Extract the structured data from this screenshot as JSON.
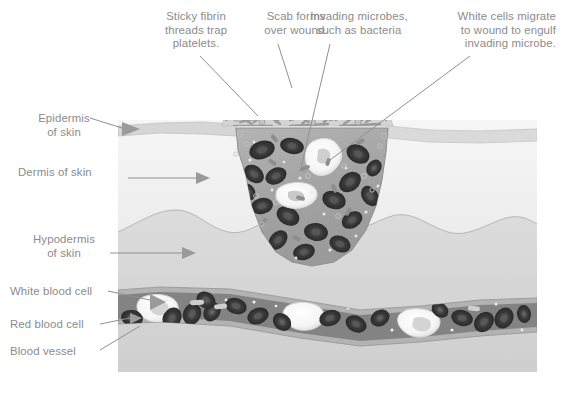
{
  "figure": {
    "background_color": "#ffffff"
  },
  "callouts": [
    {
      "id": "fibrin",
      "text": "Sticky fibrin\nthreads trap\nplatelets."
    },
    {
      "id": "scab",
      "text": "Scab forms\nover wound."
    },
    {
      "id": "microbes",
      "text": "Invading microbes,\nsuch as bacteria"
    },
    {
      "id": "whitecell",
      "text": "White cells migrate\nto wound to engulf\ninvading microbe."
    },
    {
      "id": "epidermis",
      "text": "Epidermis\nof skin"
    },
    {
      "id": "dermis",
      "text": "Dermis of skin"
    },
    {
      "id": "hypodermis",
      "text": "Hypodermis\nof skin"
    },
    {
      "id": "wbc",
      "text": "White blood cell"
    },
    {
      "id": "rbc",
      "text": "Red blood cell"
    },
    {
      "id": "vessel",
      "text": "Blood vessel"
    }
  ],
  "colors": {
    "label_text": "#8b8b8b",
    "leader_line": "#909090",
    "panel_background": "#e9e9e9",
    "epidermis": "#d8d8d8",
    "dermis": "#efefef",
    "hypodermis": "#d2d2d2",
    "wound_fill": "#a8a8a8",
    "scab_fill": "#c9c9c9",
    "fibrin_thread": "#9a9a9a",
    "platelet": "#bdbdbd",
    "vessel_wall": "#b9b9b9",
    "vessel_lumen": "#7f7f7f",
    "red_blood_cell": "#2e2e2e",
    "red_blood_cell_rim": "#5a5a5a",
    "white_blood_cell": "#fbfbfb",
    "bacteria": "#8e8e8e"
  },
  "panel": {
    "x": 118,
    "y": 120,
    "width": 419,
    "height": 252
  }
}
